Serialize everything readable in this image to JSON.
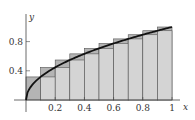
{
  "chart_data": {
    "type": "bar",
    "title": "",
    "function": "y = sqrt(x)",
    "xlabel": "x",
    "ylabel": "y",
    "xlim": [
      0,
      1.05
    ],
    "ylim": [
      0,
      1.1
    ],
    "x_ticks": [
      0.2,
      0.4,
      0.6,
      0.8,
      1
    ],
    "x_tick_labels": [
      "0.2",
      "0.4",
      "0.6",
      "0.8",
      "1"
    ],
    "y_ticks": [
      0.4,
      0.8
    ],
    "y_tick_labels": [
      "0.4",
      "0.8"
    ],
    "grid": false,
    "legend": null,
    "categories": [
      "0-0.1",
      "0.1-0.2",
      "0.2-0.3",
      "0.3-0.4",
      "0.4-0.5",
      "0.5-0.6",
      "0.6-0.7",
      "0.7-0.8",
      "0.8-0.9",
      "0.9-1.0"
    ],
    "series": [
      {
        "name": "upper (right endpoint) rectangles",
        "values": [
          0.316,
          0.447,
          0.548,
          0.632,
          0.707,
          0.775,
          0.837,
          0.894,
          0.949,
          1.0
        ],
        "color": "#b4b4b4"
      },
      {
        "name": "lower (left endpoint) rectangles",
        "values": [
          0.0,
          0.316,
          0.447,
          0.548,
          0.632,
          0.707,
          0.775,
          0.837,
          0.894,
          0.949
        ],
        "color": "#d4d4d4"
      }
    ],
    "curve": {
      "x": [
        0,
        0.01,
        0.05,
        0.1,
        0.2,
        0.3,
        0.4,
        0.5,
        0.6,
        0.7,
        0.8,
        0.9,
        1.0
      ],
      "y": [
        0,
        0.1,
        0.224,
        0.316,
        0.447,
        0.548,
        0.632,
        0.707,
        0.775,
        0.837,
        0.894,
        0.949,
        1.0
      ],
      "color": "#111111"
    }
  }
}
